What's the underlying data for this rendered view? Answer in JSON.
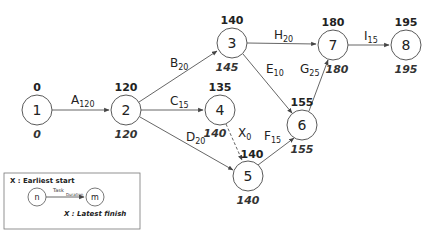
{
  "diagram": {
    "type": "activity-on-arrow network (critical path)",
    "nodes": [
      {
        "id": "1",
        "earliest_start": "0",
        "latest_finish": "0"
      },
      {
        "id": "2",
        "earliest_start": "120",
        "latest_finish": "120"
      },
      {
        "id": "3",
        "earliest_start": "140",
        "latest_finish": "145"
      },
      {
        "id": "4",
        "earliest_start": "135",
        "latest_finish": "140"
      },
      {
        "id": "5",
        "earliest_start": "140",
        "latest_finish": "140"
      },
      {
        "id": "6",
        "earliest_start": "155",
        "latest_finish": "155"
      },
      {
        "id": "7",
        "earliest_start": "180",
        "latest_finish": "180"
      },
      {
        "id": "8",
        "earliest_start": "195",
        "latest_finish": "195"
      }
    ],
    "edges": [
      {
        "from": "1",
        "to": "2",
        "task": "A",
        "duration": "120",
        "dashed": false
      },
      {
        "from": "2",
        "to": "3",
        "task": "B",
        "duration": "20",
        "dashed": false
      },
      {
        "from": "2",
        "to": "4",
        "task": "C",
        "duration": "15",
        "dashed": false
      },
      {
        "from": "2",
        "to": "5",
        "task": "D",
        "duration": "20",
        "dashed": false
      },
      {
        "from": "3",
        "to": "6",
        "task": "E",
        "duration": "10",
        "dashed": false
      },
      {
        "from": "5",
        "to": "6",
        "task": "F",
        "duration": "15",
        "dashed": false
      },
      {
        "from": "6",
        "to": "7",
        "task": "G",
        "duration": "25",
        "dashed": false
      },
      {
        "from": "3",
        "to": "7",
        "task": "H",
        "duration": "20",
        "dashed": false
      },
      {
        "from": "7",
        "to": "8",
        "task": "I",
        "duration": "15",
        "dashed": false
      },
      {
        "from": "4",
        "to": "5",
        "task": "X",
        "duration": "0",
        "dashed": true
      }
    ]
  },
  "legend": {
    "earliest_start_label": "X : Earliest start",
    "latest_finish_label": "X : Latest finish",
    "start_node": "n",
    "end_node": "m",
    "task_label": "Task",
    "duration_label": "Duration"
  }
}
